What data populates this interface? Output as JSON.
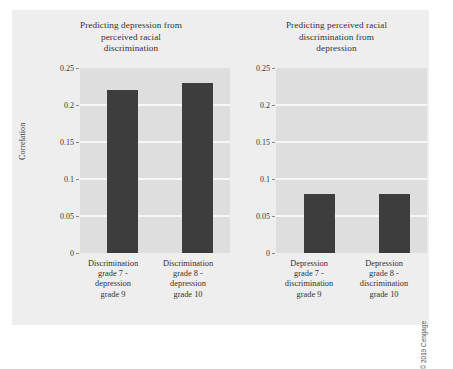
{
  "figure": {
    "credit": "© 2019 Cengage",
    "background_color": "#eeeeee",
    "plot_background_color": "#dedede",
    "bar_color": "#3d3d3d",
    "gridline_color": "#f7f7f7"
  },
  "chart_data": [
    {
      "type": "bar",
      "title": "Predicting depression from perceived racial discrimination",
      "title_lines": [
        "Predicting depression from",
        "perceived racial",
        "discrimination"
      ],
      "xlabel": "",
      "ylabel": "Correlation",
      "ylim": [
        0,
        0.25
      ],
      "yticks": [
        0,
        0.05,
        0.1,
        0.15,
        0.2,
        0.25
      ],
      "ytick_labels": [
        "0",
        "0.05",
        "0.1",
        "0.15",
        "0.2",
        "0.25"
      ],
      "grid": true,
      "legend": "none",
      "categories": [
        "Discrimination grade 7 - depression grade 9",
        "Discrimination grade 8 - depression grade 10"
      ],
      "category_lines": [
        [
          "Discrimination",
          "grade 7 -",
          "depression",
          "grade 9"
        ],
        [
          "Discrimination",
          "grade 8 -",
          "depression",
          "grade 10"
        ]
      ],
      "values": [
        0.22,
        0.23
      ]
    },
    {
      "type": "bar",
      "title": "Predicting perceived racial discrimination from depression",
      "title_lines": [
        "Predicting perceived racial",
        "discrimination from",
        "depression"
      ],
      "xlabel": "",
      "ylabel": "",
      "ylim": [
        0,
        0.25
      ],
      "yticks": [
        0,
        0.05,
        0.1,
        0.15,
        0.2,
        0.25
      ],
      "ytick_labels": [
        "0",
        "0.05",
        "0.1",
        "0.15",
        "0.2",
        "0.25"
      ],
      "grid": true,
      "legend": "none",
      "categories": [
        "Depression grade 7 - discrimination grade 9",
        "Depression grade 8 - discrimination grade 10"
      ],
      "category_lines": [
        [
          "Depression",
          "grade 7 -",
          "discrimination",
          "grade 9"
        ],
        [
          "Depression",
          "grade 8 -",
          "discrimination",
          "grade 10"
        ]
      ],
      "values": [
        0.08,
        0.08
      ]
    }
  ]
}
